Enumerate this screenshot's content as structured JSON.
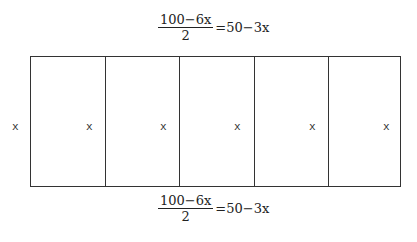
{
  "top_label": {
    "numerator": "100−6x",
    "denominator": "2",
    "rhs": "=50−3x"
  },
  "bottom_label": {
    "numerator": "100−6x",
    "denominator": "2",
    "rhs": "=50−3x"
  },
  "side_labels": [
    "x",
    "x",
    "x",
    "x",
    "x",
    "x"
  ],
  "sections": 5
}
